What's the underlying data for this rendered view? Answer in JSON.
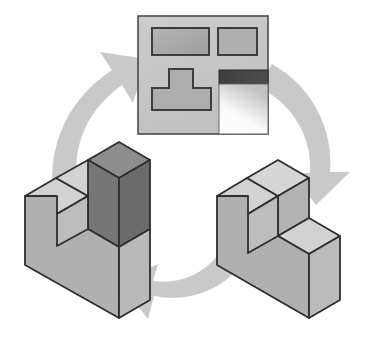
{
  "figure": {
    "title": "Isometric solid to orthographic multiview projection cycle",
    "background_color": "#ffffff"
  },
  "palette": {
    "arrow_fill": "#c9c9c9",
    "arrow_stroke": "#c9c9c9",
    "panel_fill": "#c6c6c6",
    "panel_stroke": "#4a4a4a",
    "view_fill": "#ababab",
    "view_stroke": "#3d3d3d",
    "dark_band": "#454545",
    "gradient_light": "#fbfbfb",
    "gradient_mid": "#c4c4c4",
    "solid_top": "#cfcfcf",
    "solid_front": "#a8a8a8",
    "solid_side": "#b4b4b4",
    "solid_highlight_dark": "#6f6f6f",
    "solid_highlight_dark_top": "#8d8d8d",
    "solid_stroke": "#2e2e2e"
  },
  "cycle": {
    "arrows": [
      {
        "name": "arrow-left-up",
        "label": "solid to multiview",
        "from": "isometric-solid-left",
        "to": "orthographic-panel",
        "direction": "up-right",
        "position": "upper-left"
      },
      {
        "name": "arrow-right-down",
        "label": "multiview to solid",
        "from": "orthographic-panel",
        "to": "isometric-solid-right",
        "direction": "down-right",
        "position": "upper-right"
      },
      {
        "name": "arrow-bottom-left",
        "label": "solid to solid",
        "from": "isometric-solid-right",
        "to": "isometric-solid-left",
        "direction": "down-left",
        "position": "bottom-center"
      }
    ]
  },
  "orthographic_panel": {
    "name": "orthographic-multiview-panel",
    "label": "Multiview drawing sheet",
    "views": [
      {
        "name": "view-top-left",
        "label": "Top view",
        "shape": "rectangle",
        "fill": "#ababab"
      },
      {
        "name": "view-top-right",
        "label": "Right side view",
        "shape": "square",
        "fill": "#ababab"
      },
      {
        "name": "view-front-t-shape",
        "label": "Front view",
        "shape": "tee",
        "fill": "#ababab"
      },
      {
        "name": "view-dark-band",
        "label": "Sectioned edge band",
        "shape": "rectangle",
        "fill": "#454545"
      },
      {
        "name": "view-gradient-panel",
        "label": "Shaded pictorial view",
        "shape": "rectangle",
        "fill": "gradient"
      }
    ]
  },
  "solids": [
    {
      "name": "isometric-solid-left",
      "label": "Stepped block with highlighted cube",
      "highlight": "dark cube feature",
      "position": "lower-left"
    },
    {
      "name": "isometric-solid-right",
      "label": "Stepped L block",
      "highlight": "none",
      "position": "lower-right"
    }
  ]
}
